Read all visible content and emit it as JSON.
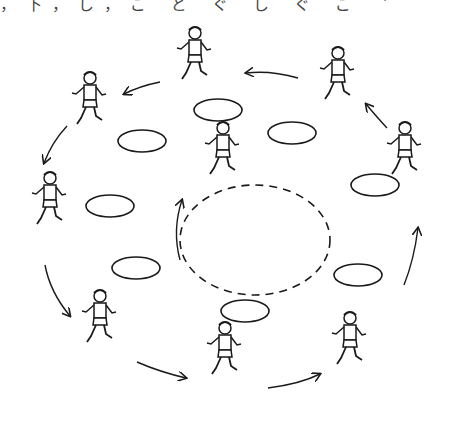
{
  "illustration": {
    "caption_cut": "，下，し，ご ど ぐ し ぐ ご ＇",
    "description": "Children running around a circle of hoops with arrows showing counterclockwise direction",
    "line_color": "#1a1a1a",
    "background": "#ffffff"
  },
  "hoops": [
    {
      "cx": 218,
      "cy": 110,
      "rx": 24,
      "ry": 11
    },
    {
      "cx": 292,
      "cy": 133,
      "rx": 24,
      "ry": 11
    },
    {
      "cx": 142,
      "cy": 141,
      "rx": 24,
      "ry": 11
    },
    {
      "cx": 110,
      "cy": 206,
      "rx": 24,
      "ry": 11
    },
    {
      "cx": 375,
      "cy": 185,
      "rx": 24,
      "ry": 11
    },
    {
      "cx": 136,
      "cy": 268,
      "rx": 24,
      "ry": 11
    },
    {
      "cx": 358,
      "cy": 275,
      "rx": 24,
      "ry": 11
    },
    {
      "cx": 245,
      "cy": 311,
      "rx": 24,
      "ry": 11
    }
  ],
  "center_circle": {
    "cx": 255,
    "cy": 240,
    "rx": 75,
    "ry": 55
  },
  "runners": [
    {
      "x": 195,
      "y": 55
    },
    {
      "x": 338,
      "y": 75
    },
    {
      "x": 90,
      "y": 100
    },
    {
      "x": 223,
      "y": 150
    },
    {
      "x": 405,
      "y": 150
    },
    {
      "x": 50,
      "y": 200
    },
    {
      "x": 100,
      "y": 318
    },
    {
      "x": 225,
      "y": 350
    },
    {
      "x": 350,
      "y": 340
    }
  ]
}
